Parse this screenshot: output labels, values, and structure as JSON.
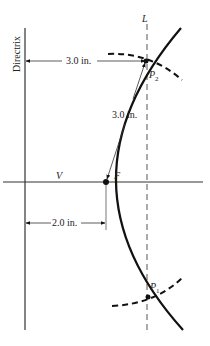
{
  "diagram": {
    "labels": {
      "directrix": "Directrix",
      "line_L": "L",
      "vertex": "V",
      "focus": "F",
      "point_p2": "P",
      "point_p2_sub": "2",
      "point_p1": "P",
      "point_p1_sub": "1",
      "dim_directrix_to_p2": "3.0 in.",
      "dim_focus_to_p2": "3.0 in.",
      "dim_directrix_to_focus": "2.0 in."
    },
    "colors": {
      "ink": "#111111",
      "background": "#ffffff"
    }
  }
}
